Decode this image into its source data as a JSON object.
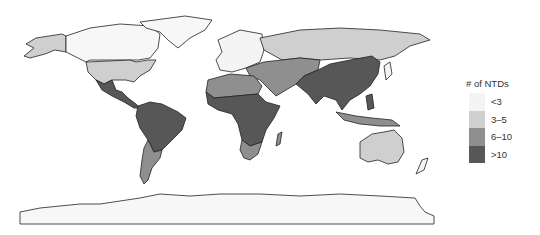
{
  "map": {
    "projection": "equirectangular world map",
    "regions": [
      {
        "name": "North America (Canada, Greenland)",
        "category": "<3"
      },
      {
        "name": "Alaska / USA",
        "category": "3–5"
      },
      {
        "name": "Mexico & Central America",
        "category": ">10"
      },
      {
        "name": "Northern South America / Brazil",
        "category": ">10"
      },
      {
        "name": "Southern South America",
        "category": "6–10"
      },
      {
        "name": "Europe",
        "category": "<3"
      },
      {
        "name": "Russia",
        "category": "3–5"
      },
      {
        "name": "Central Asia / Middle East",
        "category": "6–10"
      },
      {
        "name": "North Africa",
        "category": "6–10"
      },
      {
        "name": "Sub-Saharan Africa",
        "category": ">10"
      },
      {
        "name": "Southern Africa",
        "category": "6–10"
      },
      {
        "name": "South Asia / China / SE Asia",
        "category": ">10"
      },
      {
        "name": "Australia",
        "category": "3–5"
      },
      {
        "name": "Antarctica",
        "category": "<3"
      }
    ]
  },
  "legend": {
    "title": "# of NTDs",
    "items": [
      {
        "label": "<3",
        "color": "#f4f4f4"
      },
      {
        "label": "3–5",
        "color": "#cfcfcf"
      },
      {
        "label": "6–10",
        "color": "#8f8f8f"
      },
      {
        "label": ">10",
        "color": "#575757"
      }
    ]
  }
}
